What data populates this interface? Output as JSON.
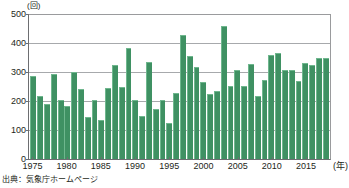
{
  "chart_data": {
    "type": "bar",
    "title": "",
    "subtitle": "",
    "xlabel": "(年)",
    "ylabel": "(回)",
    "ylim": [
      0,
      500
    ],
    "yticks": [
      0,
      100,
      200,
      300,
      400,
      500
    ],
    "ytick_labels": [
      "0",
      "100",
      "200",
      "300",
      "400",
      "500"
    ],
    "xticks": [
      1975,
      1980,
      1985,
      1990,
      1995,
      2000,
      2005,
      2010,
      2015
    ],
    "xtick_labels": [
      "1975",
      "1980",
      "1985",
      "1990",
      "1995",
      "2000",
      "2005",
      "2010",
      "2015"
    ],
    "grid": true,
    "grid_axis": "y",
    "legend": false,
    "legend_position": "none",
    "bar_color": "#3f9163",
    "categories": [
      1975,
      1976,
      1977,
      1978,
      1979,
      1980,
      1981,
      1982,
      1983,
      1984,
      1985,
      1986,
      1987,
      1988,
      1989,
      1990,
      1991,
      1992,
      1993,
      1994,
      1995,
      1996,
      1997,
      1998,
      1999,
      2000,
      2001,
      2002,
      2003,
      2004,
      2005,
      2006,
      2007,
      2008,
      2009,
      2010,
      2011,
      2012,
      2013,
      2014,
      2015,
      2016,
      2017,
      2018
    ],
    "values": [
      287,
      219,
      190,
      293,
      204,
      183,
      299,
      242,
      145,
      205,
      134,
      245,
      325,
      247,
      382,
      202,
      147,
      333,
      172,
      205,
      124,
      229,
      428,
      356,
      318,
      267,
      225,
      236,
      460,
      252,
      308,
      251,
      328,
      219,
      272,
      357,
      365,
      308,
      307,
      269,
      331,
      325,
      347,
      347
    ]
  },
  "annotations": {
    "y_unit": "(回)",
    "x_unit": "(年)",
    "source": "出典：気象庁ホームページ"
  }
}
